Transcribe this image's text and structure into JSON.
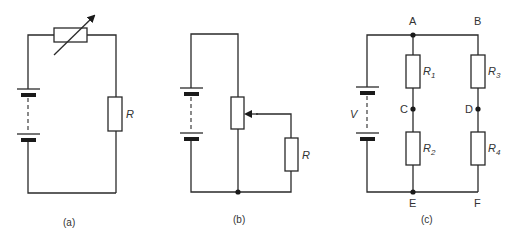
{
  "figure": {
    "panels": [
      {
        "caption": "(a)",
        "description": "Battery in series with a variable resistor (rheostat) and resistor R",
        "components": {
          "resistor_label": "R"
        }
      },
      {
        "caption": "(b)",
        "description": "Battery across a potentiometer whose wiper feeds resistor R",
        "components": {
          "resistor_label": "R"
        }
      },
      {
        "caption": "(c)",
        "description": "Supply V across two parallel branches: R1-R2 (A-C-E) and R3-R4 (B-D-F)",
        "components": {
          "voltage_label": "V",
          "node_labels": {
            "A": "A",
            "B": "B",
            "C": "C",
            "D": "D",
            "E": "E",
            "F": "F"
          },
          "resistors": [
            {
              "name": "R",
              "sub": "1"
            },
            {
              "name": "R",
              "sub": "2"
            },
            {
              "name": "R",
              "sub": "3"
            },
            {
              "name": "R",
              "sub": "4"
            }
          ]
        }
      }
    ],
    "colors": {
      "line": "#2a2a2a",
      "background": "#ffffff"
    }
  }
}
